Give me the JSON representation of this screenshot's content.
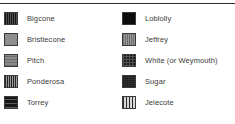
{
  "chart_data": {
    "type": "table",
    "title": "",
    "subtitle": "",
    "xlabel": "",
    "ylabel": "",
    "legend_position": "standalone",
    "grid": false,
    "columns": 2,
    "rows_per_column": 5,
    "categories": [
      "Bigcone",
      "Bristlecone",
      "Pitch",
      "Ponderosa",
      "Torrey",
      "Loblolly",
      "Jeffrey",
      "White (or Weymouth)",
      "Sugar",
      "Jelecote"
    ],
    "series": [
      {
        "name": "pattern_swatches",
        "values": [
          "vertical-stripe-dark",
          "solid-mid-gray",
          "horizontal-band-mid-gray",
          "vertical-stripe-light",
          "horizontal-line-dark",
          "solid-black",
          "vertical-line-mid-gray",
          "crosshatch-dark",
          "crosshatch-fine-dark",
          "vertical-stripe-wide"
        ]
      }
    ]
  },
  "legend": {
    "rule_color": "#2b2b2b",
    "text_color": "#3b3b3b",
    "swatch_border_color": "#3a3a3a",
    "background_color": "#ffffff",
    "columns": [
      {
        "name": "left-column",
        "items": [
          {
            "label": "Bigcone",
            "swatch": "vertical-stripe-dark",
            "swatch_class": "pat-vstripe-dark"
          },
          {
            "label": "Bristlecone",
            "swatch": "solid-mid-gray",
            "swatch_class": "pat-solid-mid"
          },
          {
            "label": "Pitch",
            "swatch": "horizontal-band-mid-gray",
            "swatch_class": "pat-hband-mid"
          },
          {
            "label": "Ponderosa",
            "swatch": "vertical-stripe-light",
            "swatch_class": "pat-vstripe-light"
          },
          {
            "label": "Torrey",
            "swatch": "horizontal-line-dark",
            "swatch_class": "pat-hline-dark"
          }
        ]
      },
      {
        "name": "right-column",
        "items": [
          {
            "label": "Loblolly",
            "swatch": "solid-black",
            "swatch_class": "pat-solid-black"
          },
          {
            "label": "Jeffrey",
            "swatch": "vertical-line-mid-gray",
            "swatch_class": "pat-vline-mid"
          },
          {
            "label": "White (or Weymouth)",
            "swatch": "crosshatch-dark",
            "swatch_class": "pat-cross-dark"
          },
          {
            "label": "Sugar",
            "swatch": "crosshatch-fine-dark",
            "swatch_class": "pat-cross-fine"
          },
          {
            "label": "Jelecote",
            "swatch": "vertical-stripe-wide",
            "swatch_class": "pat-vstripe-wide"
          }
        ]
      }
    ]
  }
}
